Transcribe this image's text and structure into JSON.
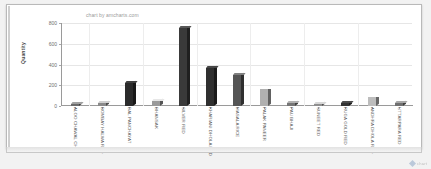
{
  "watermark": "chart by amcharts.com",
  "corner": {
    "label": "chart"
  },
  "chart_data": {
    "type": "bar",
    "title": "",
    "subtitle": "",
    "xlabel": "",
    "ylabel": "Quantity",
    "ylim": [
      0,
      800
    ],
    "yticks": [
      0,
      200,
      400,
      600,
      800
    ],
    "grid": true,
    "legend": false,
    "legend_position": "none",
    "categories": [
      "ALOO CHAWAL CHAT",
      "BOMBAY HALWA RED",
      "DAL PANCHAYAT",
      "DHANSAK",
      "SILVER RED",
      "KHARIANI DHOLA RED",
      "MASALA RICE",
      "PALAK PANEER",
      "PAU BHAJI",
      "SUNEET RED",
      "RUGA GOLD RED",
      "ANDHRA DHOLA RED",
      "UTTARPARA RED"
    ],
    "values": [
      20,
      30,
      220,
      45,
      750,
      370,
      300,
      165,
      25,
      20,
      25,
      90,
      30
    ],
    "bar_colors": [
      "#6b6b6b",
      "#8a8a8a",
      "#2b2b2b",
      "#9a9a9a",
      "#3a3a3a",
      "#2f2f2f",
      "#555555",
      "#b0b0b0",
      "#767676",
      "#8f8f8f",
      "#333333",
      "#bdbdbd",
      "#707070"
    ]
  }
}
